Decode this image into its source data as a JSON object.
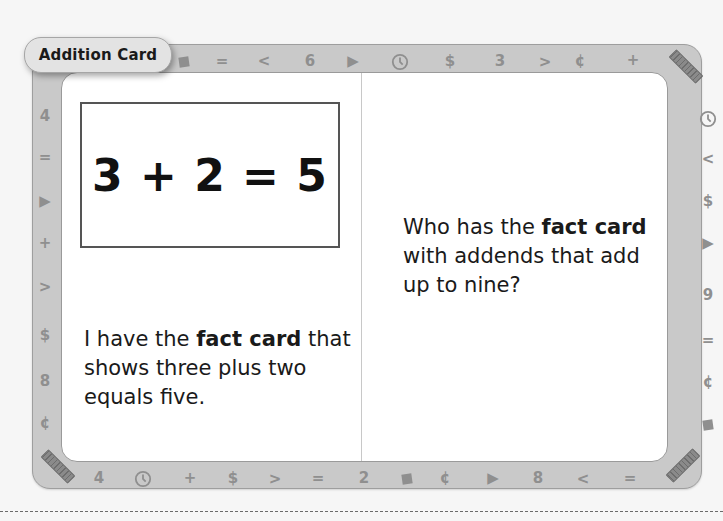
{
  "card": {
    "title": "Addition Card",
    "equation": "3 + 2 = 5",
    "left_text": {
      "part1": "I have the ",
      "bold": "fact card",
      "part2": " that shows three plus two equals five."
    },
    "right_text": {
      "part1": "Who has the ",
      "bold": "fact card",
      "part2": " with addends that add up to nine?"
    }
  },
  "border": {
    "top": [
      "square",
      "=",
      "<",
      "6",
      "triangle",
      "clock",
      "$",
      "3",
      ">",
      "¢",
      "+"
    ],
    "right": [
      "clock",
      "<",
      "$",
      "triangle",
      "9",
      "=",
      "¢",
      "square"
    ],
    "bottom": [
      "4",
      "clock",
      "+",
      "$",
      ">",
      "=",
      "2",
      "square",
      "¢",
      "triangle",
      "8",
      "<",
      "="
    ],
    "left": [
      "4",
      "=",
      "triangle",
      "+",
      ">",
      "$",
      "8",
      "¢"
    ],
    "corner_icons": [
      "ruler",
      "ruler",
      "ruler"
    ]
  },
  "colors": {
    "frame": "#c9c9c9",
    "icon": "#8f8f8f",
    "text": "#1a1a1a",
    "panel": "#ffffff"
  }
}
